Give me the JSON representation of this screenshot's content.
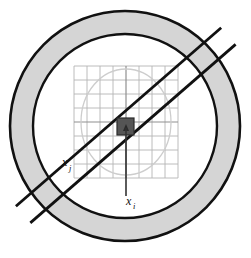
{
  "figure": {
    "background_color": "#ffffff",
    "labels": {
      "x_j": {
        "base": "x",
        "subscript": "j",
        "x": 62,
        "y": 166
      },
      "x_i": {
        "base": "x",
        "subscript": "i",
        "x": 126,
        "y": 205
      }
    },
    "colors": {
      "annulus_fill": "#d5d5d5",
      "annulus_stroke": "#111111",
      "band_stroke": "#111111",
      "grid_line": "#b0b0b0",
      "grid_line_major": "#8a8a8a",
      "inner_circle_stroke": "#cfcfcf",
      "center_square_fill": "#555555",
      "center_square_stroke": "#222222",
      "arrow_stroke": "#333333",
      "label_color": "#111111"
    },
    "geometry": {
      "center": {
        "x": 125,
        "y": 126
      },
      "outer_circle_radius": 115,
      "inner_circle_radius": 92,
      "annulus_thickness": 23,
      "band_half_width": 11,
      "band_angle_deg": -41,
      "grid": {
        "left": 74,
        "top": 66,
        "right": 178,
        "bottom": 178,
        "cell_size": 13,
        "columns": 8,
        "rows": 8,
        "major_columns": [
          4
        ],
        "major_rows": [
          4
        ]
      },
      "light_ellipse": {
        "cx": 126,
        "cy": 122,
        "rx": 45,
        "ry": 53
      },
      "center_square": {
        "x": 117,
        "y": 118,
        "size": 17
      },
      "arrow": {
        "x": 126,
        "y_top": 131,
        "y_bottom": 196
      }
    }
  }
}
